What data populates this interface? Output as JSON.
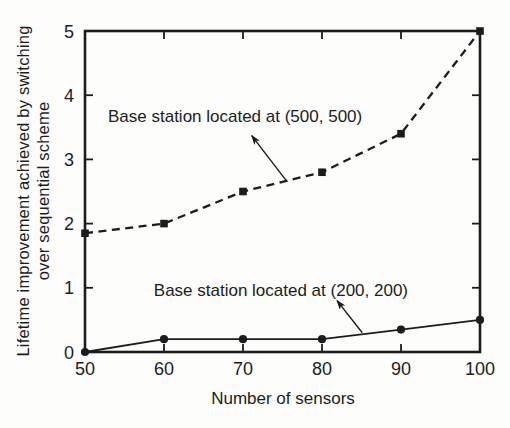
{
  "figure": {
    "background": "#fdfdfc",
    "ink_color": "#1c1c1c"
  },
  "chart_data": {
    "type": "line",
    "title": "",
    "xlabel": "Number of sensors",
    "ylabel": "Lifetime improvement achieved by switching over sequential scheme",
    "ylabel_line1": "Lifetime improvement achieved by switching",
    "ylabel_line2": "over sequential scheme",
    "xlim": [
      50,
      100
    ],
    "ylim": [
      0,
      5
    ],
    "xticks": [
      50,
      60,
      70,
      80,
      90,
      100
    ],
    "yticks": [
      0,
      1,
      2,
      3,
      4,
      5
    ],
    "grid": false,
    "legend_position": "none",
    "x": [
      50,
      60,
      70,
      80,
      90,
      100
    ],
    "series": [
      {
        "name": "Base station located at (500, 500)",
        "values": [
          1.85,
          2.0,
          2.5,
          2.8,
          3.4,
          5.0
        ],
        "line_style": "dashed",
        "marker": "square"
      },
      {
        "name": "Base station located at (200, 200)",
        "values": [
          0.0,
          0.2,
          0.2,
          0.2,
          0.35,
          0.5
        ],
        "line_style": "solid",
        "marker": "circle"
      }
    ],
    "annotations": [
      {
        "text": "Base station located at (500, 500)",
        "text_x": 69.0,
        "text_y": 3.66,
        "arrow_from_x": 75.6,
        "arrow_from_y": 2.65,
        "arrow_to_x": 71.1,
        "arrow_to_y": 3.37
      },
      {
        "text": "Base station located at (200, 200)",
        "text_x": 74.8,
        "text_y": 0.95,
        "arrow_from_x": 85.1,
        "arrow_from_y": 0.3,
        "arrow_to_x": 81.9,
        "arrow_to_y": 0.8
      }
    ]
  }
}
